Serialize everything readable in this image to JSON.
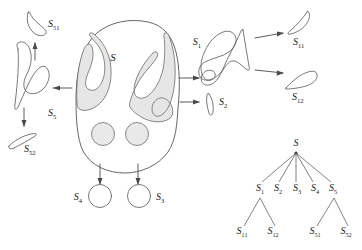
{
  "figure": {
    "colors": {
      "stroke": "#555555",
      "shade_fill": "#e6e6e6",
      "hole_fill": "#e9e9e9",
      "background": "#ffffff",
      "text": "#1a1a1a",
      "arrow": "#4a4a4a",
      "tree_edge": "#5a5a5a"
    },
    "labels": {
      "root": "S",
      "root_sub": "",
      "s1": "S",
      "s1_sub": "1",
      "s2": "S",
      "s2_sub": "2",
      "s3": "S",
      "s3_sub": "3",
      "s4": "S",
      "s4_sub": "4",
      "s5": "S",
      "s5_sub": "5",
      "s11": "S",
      "s11_sub": "11",
      "s12": "S",
      "s12_sub": "12",
      "s51": "S",
      "s51_sub": "51",
      "s52": "S",
      "s52_sub": "52"
    },
    "tree": {
      "root": {
        "label": "S",
        "sub": ""
      },
      "level1": [
        {
          "label": "S",
          "sub": "1"
        },
        {
          "label": "S",
          "sub": "2"
        },
        {
          "label": "S",
          "sub": "3"
        },
        {
          "label": "S",
          "sub": "4"
        },
        {
          "label": "S",
          "sub": "5"
        }
      ],
      "level2": [
        {
          "label": "S",
          "sub": "11",
          "parent": "S1"
        },
        {
          "label": "S",
          "sub": "12",
          "parent": "S1"
        },
        {
          "label": "S",
          "sub": "51",
          "parent": "S5"
        },
        {
          "label": "S",
          "sub": "52",
          "parent": "S5"
        }
      ]
    },
    "parts": [
      {
        "name": "main-shape",
        "label": "S",
        "sub": ""
      },
      {
        "name": "part-s1",
        "label": "S",
        "sub": "1"
      },
      {
        "name": "part-s2",
        "label": "S",
        "sub": "2"
      },
      {
        "name": "part-s3",
        "label": "S",
        "sub": "3"
      },
      {
        "name": "part-s4",
        "label": "S",
        "sub": "4"
      },
      {
        "name": "part-s5",
        "label": "S",
        "sub": "5"
      },
      {
        "name": "part-s11",
        "label": "S",
        "sub": "11"
      },
      {
        "name": "part-s12",
        "label": "S",
        "sub": "12"
      },
      {
        "name": "part-s51",
        "label": "S",
        "sub": "51"
      },
      {
        "name": "part-s52",
        "label": "S",
        "sub": "52"
      }
    ]
  }
}
